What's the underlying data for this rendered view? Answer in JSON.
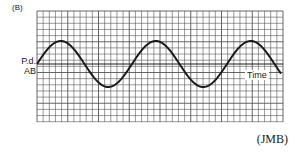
{
  "figure": {
    "label": "(B)",
    "ylabel_line1": "P.d.",
    "ylabel_line2": "AB",
    "xlabel": "Time",
    "source": "(JMB)"
  },
  "chart_data": {
    "type": "line",
    "title": "(B)",
    "xlabel": "Time",
    "ylabel": "P.d. AB",
    "grid": true,
    "series": [
      {
        "name": "P.d. AB",
        "function": "sine",
        "amplitude_cells": 4,
        "period_cells": 15.5,
        "cycles": 2.6,
        "phase": 0
      }
    ],
    "ylim": [
      -8,
      8
    ]
  },
  "layout": {
    "grid": {
      "x0": 37,
      "y0": 11,
      "x1": 283,
      "y1": 122,
      "cell": 6.15
    },
    "axis_y": 64,
    "amplitude_px": 23,
    "period_px": 95
  },
  "colors": {
    "ink": "#1a1a1a",
    "grid": "#555555",
    "background": "#ffffff"
  }
}
